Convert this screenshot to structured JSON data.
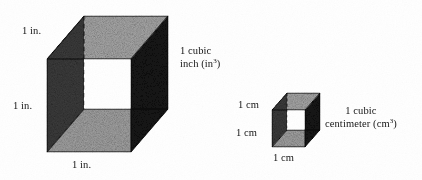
{
  "figure": {
    "type": "geometry-diagram",
    "background_color": "#ffffff",
    "text_color": "#151515"
  },
  "colors": {
    "face_top": "#a9a9a9",
    "face_bottom_inner": "#a3a3a3",
    "face_left": "#3c3c3c",
    "face_right": "#161616",
    "edge": "#111111",
    "hidden_edge": "#141414"
  },
  "inch_cube": {
    "name": "1 cubic inch cube",
    "labels": {
      "top_edge": "1 in.",
      "left_edge": "1 in.",
      "bottom_edge": "1 in."
    },
    "caption_line1": "1 cubic",
    "caption_line2_prefix": "inch (in",
    "caption_exponent": "3",
    "caption_line2_suffix": ")"
  },
  "cm_cube": {
    "name": "1 cubic centimeter cube",
    "labels": {
      "top_edge": "1 cm",
      "left_edge": "1 cm",
      "bottom_edge": "1 cm"
    },
    "caption_line1": "1 cubic",
    "caption_line2_prefix": "centimeter (cm",
    "caption_exponent": "3",
    "caption_line2_suffix": ")"
  }
}
